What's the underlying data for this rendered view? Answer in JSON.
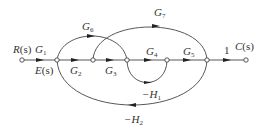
{
  "diagram": {
    "type": "signal-flow-graph",
    "nodes": [
      {
        "id": "R",
        "x": 22,
        "y": 60
      },
      {
        "id": "E",
        "x": 57,
        "y": 60
      },
      {
        "id": "n2",
        "x": 93,
        "y": 60
      },
      {
        "id": "n3",
        "x": 127,
        "y": 60
      },
      {
        "id": "n4",
        "x": 167,
        "y": 60
      },
      {
        "id": "n5",
        "x": 207,
        "y": 60
      },
      {
        "id": "C",
        "x": 246,
        "y": 60
      }
    ],
    "labels": {
      "input": {
        "main": "R",
        "arg": "(s)"
      },
      "error": {
        "main": "E",
        "arg": "(s)"
      },
      "output": {
        "main": "C",
        "arg": "(s)"
      },
      "g1": {
        "main": "G",
        "sub": "1"
      },
      "g2": {
        "main": "G",
        "sub": "2"
      },
      "g3": {
        "main": "G",
        "sub": "3"
      },
      "g4": {
        "main": "G",
        "sub": "4"
      },
      "g5": {
        "main": "G",
        "sub": "5"
      },
      "g6": {
        "main": "G",
        "sub": "6"
      },
      "g7": {
        "main": "G",
        "sub": "7"
      },
      "h1": {
        "main": "−H",
        "sub": "1"
      },
      "h2": {
        "main": "−H",
        "sub": "2"
      },
      "unity": "1"
    },
    "edges": [
      {
        "from": "R",
        "to": "E",
        "gain": "G1"
      },
      {
        "from": "E",
        "to": "n2",
        "gain": "G2"
      },
      {
        "from": "n2",
        "to": "n3",
        "gain": "G3"
      },
      {
        "from": "n3",
        "to": "n4",
        "gain": "G4"
      },
      {
        "from": "n4",
        "to": "n5",
        "gain": "G5"
      },
      {
        "from": "n5",
        "to": "C",
        "gain": "1"
      },
      {
        "from": "E",
        "to": "n3",
        "gain": "G6"
      },
      {
        "from": "n2",
        "to": "n5",
        "gain": "G7"
      },
      {
        "from": "n3",
        "to": "n4",
        "gain": "-H1",
        "path": "lower loop"
      },
      {
        "from": "n5",
        "to": "E",
        "gain": "-H2"
      }
    ]
  }
}
